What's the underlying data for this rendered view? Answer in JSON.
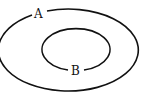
{
  "diagram": {
    "type": "nested-sets",
    "outer_set": {
      "label": "A",
      "stroke": "#111111"
    },
    "inner_set": {
      "label": "B",
      "stroke": "#111111"
    },
    "background": "#ffffff"
  }
}
